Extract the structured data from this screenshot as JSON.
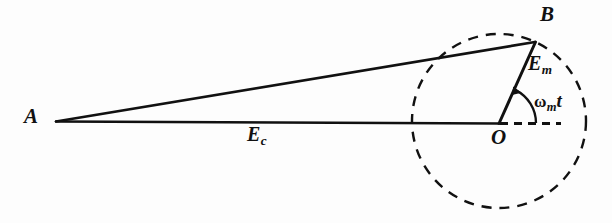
{
  "figure": {
    "type": "phasor-diagram",
    "background_color": "#fdfdfd",
    "stroke_color": "#111111",
    "width": 612,
    "height": 223,
    "points": {
      "A": {
        "x": 56,
        "y": 121,
        "label": "A"
      },
      "O": {
        "x": 499,
        "y": 123,
        "label": "O"
      },
      "B": {
        "x": 535,
        "y": 42,
        "label": "B"
      }
    },
    "circle": {
      "center_label": "O",
      "cx": 499,
      "cy": 121,
      "r": 87,
      "style": "dashed"
    },
    "segments": [
      {
        "name": "carrier-vector",
        "from": "A",
        "to": "O",
        "label": "Ec",
        "style": "solid"
      },
      {
        "name": "resultant-vector",
        "from": "A",
        "to": "B",
        "label": "",
        "style": "solid"
      },
      {
        "name": "modulation-vector",
        "from": "O",
        "to": "B",
        "label": "Em",
        "style": "solid"
      },
      {
        "name": "reference-axis",
        "from": "O",
        "to": "right",
        "label": "",
        "style": "dashed"
      }
    ],
    "angle_arc": {
      "name": "omega-m-t",
      "vertex": "O",
      "from_deg": 0,
      "to_deg": 66,
      "radius": 37,
      "arrow": "counterclockwise"
    },
    "labels": {
      "A": "A",
      "B": "B",
      "O": "O",
      "Ec_main": "E",
      "Ec_sub": "c",
      "Em_main": "E",
      "Em_sub": "m",
      "omega": "ω",
      "omega_sub": "m",
      "time": "t"
    }
  }
}
